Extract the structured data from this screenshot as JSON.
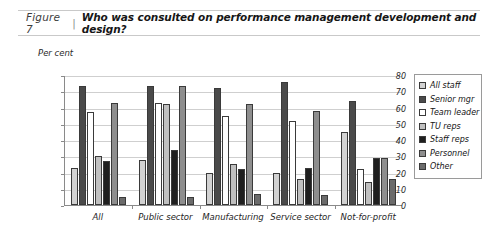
{
  "header": {
    "figure_number": "Figure 7",
    "separator": "|",
    "title": "Who was consulted on performance management development and design?"
  },
  "chart_data": {
    "type": "bar",
    "title": "Who was consulted on performance management development and design?",
    "xlabel": "",
    "ylabel": "Per cent",
    "ylim": [
      0,
      80
    ],
    "yticks": [
      0,
      10,
      20,
      30,
      40,
      50,
      60,
      70,
      80
    ],
    "grid": true,
    "legend_position": "right",
    "categories": [
      "All",
      "Public sector",
      "Manufacturing",
      "Service sector",
      "Not-for-profit"
    ],
    "series": [
      {
        "name": "All staff",
        "color": "#d2d2d2",
        "values": [
          23,
          28,
          20,
          20,
          45
        ]
      },
      {
        "name": "Senior mgr",
        "color": "#4a4a4a",
        "values": [
          73,
          73,
          72,
          76,
          64
        ]
      },
      {
        "name": "Team leader",
        "color": "#ffffff",
        "values": [
          57,
          63,
          55,
          52,
          22
        ]
      },
      {
        "name": "TU reps",
        "color": "#c0c0c0",
        "values": [
          30,
          62,
          25,
          16,
          14
        ]
      },
      {
        "name": "Staff reps",
        "color": "#1f1f1f",
        "values": [
          27,
          34,
          22,
          23,
          29
        ]
      },
      {
        "name": "Personnel",
        "color": "#8e8e8e",
        "values": [
          63,
          73,
          62,
          58,
          29
        ]
      },
      {
        "name": "Other",
        "color": "#6b6b6b",
        "values": [
          5,
          5,
          7,
          6,
          16
        ]
      }
    ]
  }
}
